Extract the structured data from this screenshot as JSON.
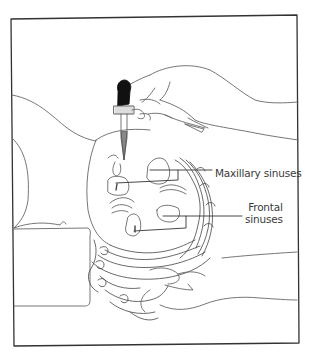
{
  "figure": {
    "labels": {
      "maxillary": "Maxillary sinuses",
      "frontal_line1": "Frontal",
      "frontal_line2": "sinuses"
    },
    "colors": {
      "line": "#555555",
      "frame": "#333333",
      "background": "#ffffff"
    }
  }
}
